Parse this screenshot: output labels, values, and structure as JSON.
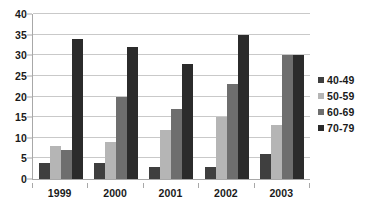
{
  "chart_data": {
    "type": "bar",
    "title": "",
    "subtitle": "",
    "xlabel": "",
    "ylabel": "",
    "categories": [
      "1999",
      "2000",
      "2001",
      "2002",
      "2003"
    ],
    "series": [
      {
        "name": "40-49",
        "color": "#3f3f3f",
        "values": [
          4,
          4,
          3,
          3,
          6
        ]
      },
      {
        "name": "50-59",
        "color": "#b5b5b5",
        "values": [
          8,
          9,
          12,
          15,
          13
        ]
      },
      {
        "name": "60-69",
        "color": "#6e6e6e",
        "values": [
          7,
          20,
          17,
          23,
          30
        ]
      },
      {
        "name": "70-79",
        "color": "#2b2b2b",
        "values": [
          34,
          32,
          28,
          35,
          30
        ]
      }
    ],
    "ylim": [
      0,
      40
    ],
    "ytick_values": [
      0,
      5,
      10,
      15,
      20,
      25,
      30,
      35,
      40
    ],
    "ytick_labels": [
      "0",
      "5",
      "10",
      "15",
      "20",
      "25",
      "30",
      "35",
      "40"
    ],
    "grid": true,
    "grid_axis": "y",
    "legend_position": "right",
    "orientation": "vertical",
    "background_color": "#ffffff",
    "grid_color": "#c9c9c9",
    "axis_color": "#a8a8a8",
    "text_color": "#1a1a1a"
  }
}
